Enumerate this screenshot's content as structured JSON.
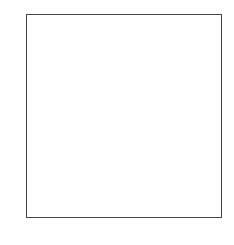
{
  "board": {
    "files": [
      "a",
      "b",
      "c",
      "d",
      "e",
      "f",
      "g",
      "h"
    ],
    "ranks": [
      "8",
      "7",
      "6",
      "5",
      "4",
      "3",
      "2",
      "1"
    ],
    "light_color": "#ffffff",
    "dark_color": "#8c8c8c",
    "pieces": [
      {
        "square": "b8",
        "piece": "rook",
        "color": "white",
        "glyph": "♖"
      },
      {
        "square": "e8",
        "piece": "king",
        "color": "black",
        "glyph": "♚"
      },
      {
        "square": "a7",
        "piece": "rook",
        "color": "white",
        "glyph": "♖"
      },
      {
        "square": "e1",
        "piece": "king",
        "color": "white",
        "glyph": "♔"
      }
    ],
    "arrows": [
      {
        "from": "b6",
        "to": "b8"
      }
    ]
  }
}
